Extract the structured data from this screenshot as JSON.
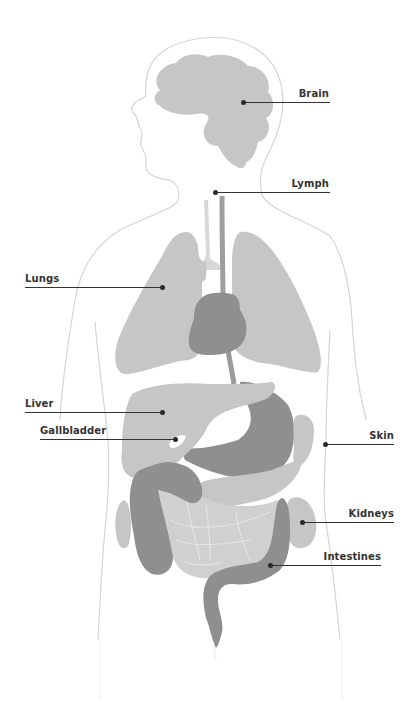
{
  "diagram": {
    "type": "human-anatomy-organ-labels",
    "colors": {
      "background": "#ffffff",
      "outline": "#d4d4d4",
      "organ_light": "#c6c6c6",
      "organ_dark": "#8f8f8f",
      "label_text": "#333333",
      "leader_line": "#333333"
    },
    "labels": [
      {
        "id": "brain",
        "text": "Brain",
        "side": "right"
      },
      {
        "id": "lymph",
        "text": "Lymph",
        "side": "right"
      },
      {
        "id": "lungs",
        "text": "Lungs",
        "side": "left"
      },
      {
        "id": "liver",
        "text": "Liver",
        "side": "left"
      },
      {
        "id": "gallbladder",
        "text": "Gallbladder",
        "side": "left"
      },
      {
        "id": "skin",
        "text": "Skin",
        "side": "right"
      },
      {
        "id": "kidneys",
        "text": "Kidneys",
        "side": "right"
      },
      {
        "id": "intestines",
        "text": "Intestines",
        "side": "right"
      }
    ]
  }
}
